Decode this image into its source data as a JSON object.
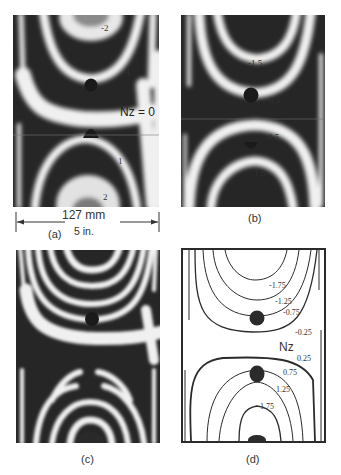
{
  "figure": {
    "panels": [
      {
        "id": "a",
        "caption": "(a)",
        "type": "fringe-photo",
        "labels": {
          "n_minus_2": "-2",
          "n_minus_1": "-1",
          "nz": "Nz = 0",
          "n_1": "1",
          "n_2": "2"
        }
      },
      {
        "id": "b",
        "caption": "(b)",
        "type": "fringe-photo",
        "labels": {
          "n_minus_1_5": "-1.5",
          "n_minus_0_5": "-0.5",
          "n_0_5": "0.5",
          "n_1_5": "1.5"
        }
      },
      {
        "id": "c",
        "caption": "(c)",
        "type": "fringe-photo"
      },
      {
        "id": "d",
        "caption": "(d)",
        "type": "contour-drawing",
        "labels": {
          "m1_75": "-1.75",
          "m1_25": "-1.25",
          "m0_75": "-0.75",
          "m0_25": "-0.25",
          "nz": "Nz",
          "p0_25": "0.25",
          "p0_75": "0.75",
          "p1_25": "1.25",
          "p1_75": "1.75"
        }
      }
    ],
    "dimension": {
      "metric": "127 mm",
      "imperial": "5 in."
    }
  },
  "colors": {
    "fringe_dark": "#262626",
    "fringe_light": "#f2f2f2",
    "contour_line": "#2b2b2b"
  }
}
